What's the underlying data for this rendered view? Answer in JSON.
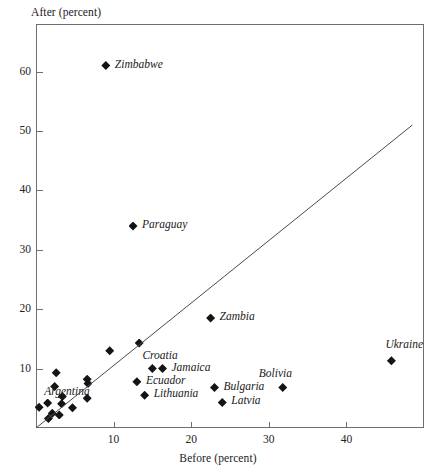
{
  "chart_data": {
    "type": "scatter",
    "title": "",
    "xlabel": "Before (percent)",
    "ylabel": "After (percent)",
    "xlim": [
      0,
      50
    ],
    "ylim": [
      0,
      68
    ],
    "grid": false,
    "legend": null,
    "xticks": [
      10,
      20,
      30,
      40
    ],
    "yticks": [
      10,
      20,
      30,
      40,
      50,
      60
    ],
    "xtick_labels": [
      "10",
      "20",
      "30",
      "40"
    ],
    "ytick_labels": [
      "10",
      "20",
      "30",
      "40",
      "50",
      "60"
    ],
    "annotations": [
      {
        "text": "Zimbabwe",
        "x": 9.0,
        "y": 61.0
      },
      {
        "text": "Paraguay",
        "x": 12.5,
        "y": 34.0
      },
      {
        "text": "Zambia",
        "x": 22.5,
        "y": 18.5
      },
      {
        "text": "Croatia",
        "x": 15.0,
        "y": 10.0
      },
      {
        "text": "Jamaica",
        "x": 16.3,
        "y": 10.0
      },
      {
        "text": "Ukraine",
        "x": 45.8,
        "y": 11.3
      },
      {
        "text": "Bolivia",
        "x": 31.8,
        "y": 6.8
      },
      {
        "text": "Ecuador",
        "x": 13.0,
        "y": 7.8
      },
      {
        "text": "Bulgaria",
        "x": 23.0,
        "y": 6.8
      },
      {
        "text": "Argentina",
        "x": 2.6,
        "y": 7.0
      },
      {
        "text": "Lithuania",
        "x": 14.0,
        "y": 5.5
      },
      {
        "text": "Latvia",
        "x": 24.0,
        "y": 4.3
      }
    ],
    "reference_line": {
      "x0": 0.0,
      "y0": 0.0,
      "x1": 48.5,
      "y1": 51.0,
      "label": "45-degree reference line"
    },
    "points": [
      {
        "label": "Zimbabwe",
        "x": 9.0,
        "y": 61.0
      },
      {
        "label": "Paraguay",
        "x": 12.5,
        "y": 34.0
      },
      {
        "label": "Zambia",
        "x": 22.5,
        "y": 18.5
      },
      {
        "label": "",
        "x": 13.3,
        "y": 14.3
      },
      {
        "label": "",
        "x": 9.5,
        "y": 13.0
      },
      {
        "label": "Ukraine",
        "x": 45.8,
        "y": 11.3
      },
      {
        "label": "Croatia",
        "x": 15.0,
        "y": 10.0
      },
      {
        "label": "Jamaica",
        "x": 16.3,
        "y": 10.0
      },
      {
        "label": "Argentina",
        "x": 2.6,
        "y": 9.3
      },
      {
        "label": "",
        "x": 6.6,
        "y": 8.2
      },
      {
        "label": "",
        "x": 6.7,
        "y": 7.5
      },
      {
        "label": "Ecuador",
        "x": 13.0,
        "y": 7.8
      },
      {
        "label": "",
        "x": 2.4,
        "y": 7.0
      },
      {
        "label": "Bulgaria",
        "x": 23.0,
        "y": 6.8
      },
      {
        "label": "Bolivia",
        "x": 31.8,
        "y": 6.8
      },
      {
        "label": "Lithuania",
        "x": 14.0,
        "y": 5.5
      },
      {
        "label": "",
        "x": 3.4,
        "y": 5.3
      },
      {
        "label": "",
        "x": 6.6,
        "y": 5.0
      },
      {
        "label": "Latvia",
        "x": 24.0,
        "y": 4.3
      },
      {
        "label": "",
        "x": 1.5,
        "y": 4.2
      },
      {
        "label": "",
        "x": 3.3,
        "y": 4.1
      },
      {
        "label": "",
        "x": 0.4,
        "y": 3.5
      },
      {
        "label": "",
        "x": 4.7,
        "y": 3.4
      },
      {
        "label": "",
        "x": 2.1,
        "y": 2.5
      },
      {
        "label": "",
        "x": 3.0,
        "y": 2.2
      },
      {
        "label": "",
        "x": 1.6,
        "y": 1.6
      }
    ]
  }
}
